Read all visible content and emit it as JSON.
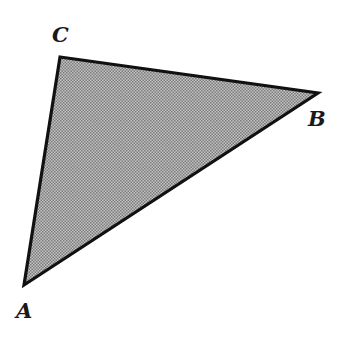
{
  "diagram": {
    "type": "triangle",
    "fill_color": "#a8a8a8",
    "stroke_color": "#111111",
    "stroke_width": 3.2,
    "vertices": {
      "A": {
        "label": "A",
        "x": 24,
        "y": 285
      },
      "B": {
        "label": "B",
        "x": 318,
        "y": 93
      },
      "C": {
        "label": "C",
        "x": 60,
        "y": 57
      }
    },
    "labels": {
      "A": "A",
      "B": "B",
      "C": "C"
    }
  }
}
